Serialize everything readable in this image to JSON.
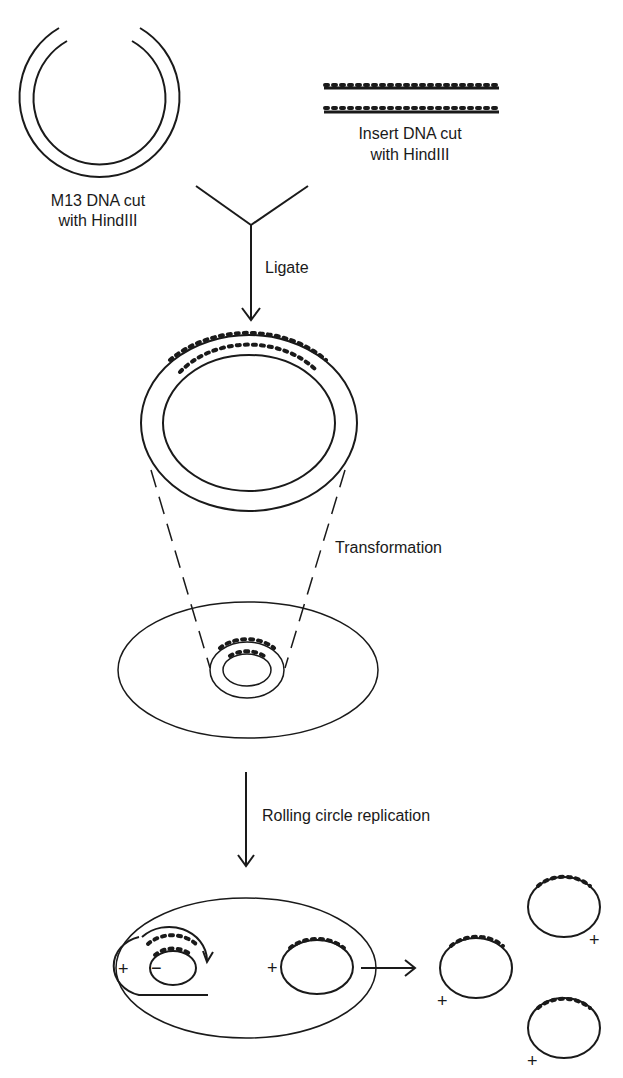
{
  "diagram": {
    "labels": {
      "m13_vector": [
        "M13 DNA cut",
        "with HindIII"
      ],
      "insert": [
        "Insert DNA cut",
        "with HindIII"
      ],
      "step_ligate": "Ligate",
      "step_transformation": "Transformation",
      "step_replication": "Rolling circle replication"
    },
    "strand_signs": {
      "plus": "+",
      "minus": "−"
    },
    "colors": {
      "line": "#1a1a1a",
      "background": "#ffffff"
    }
  }
}
